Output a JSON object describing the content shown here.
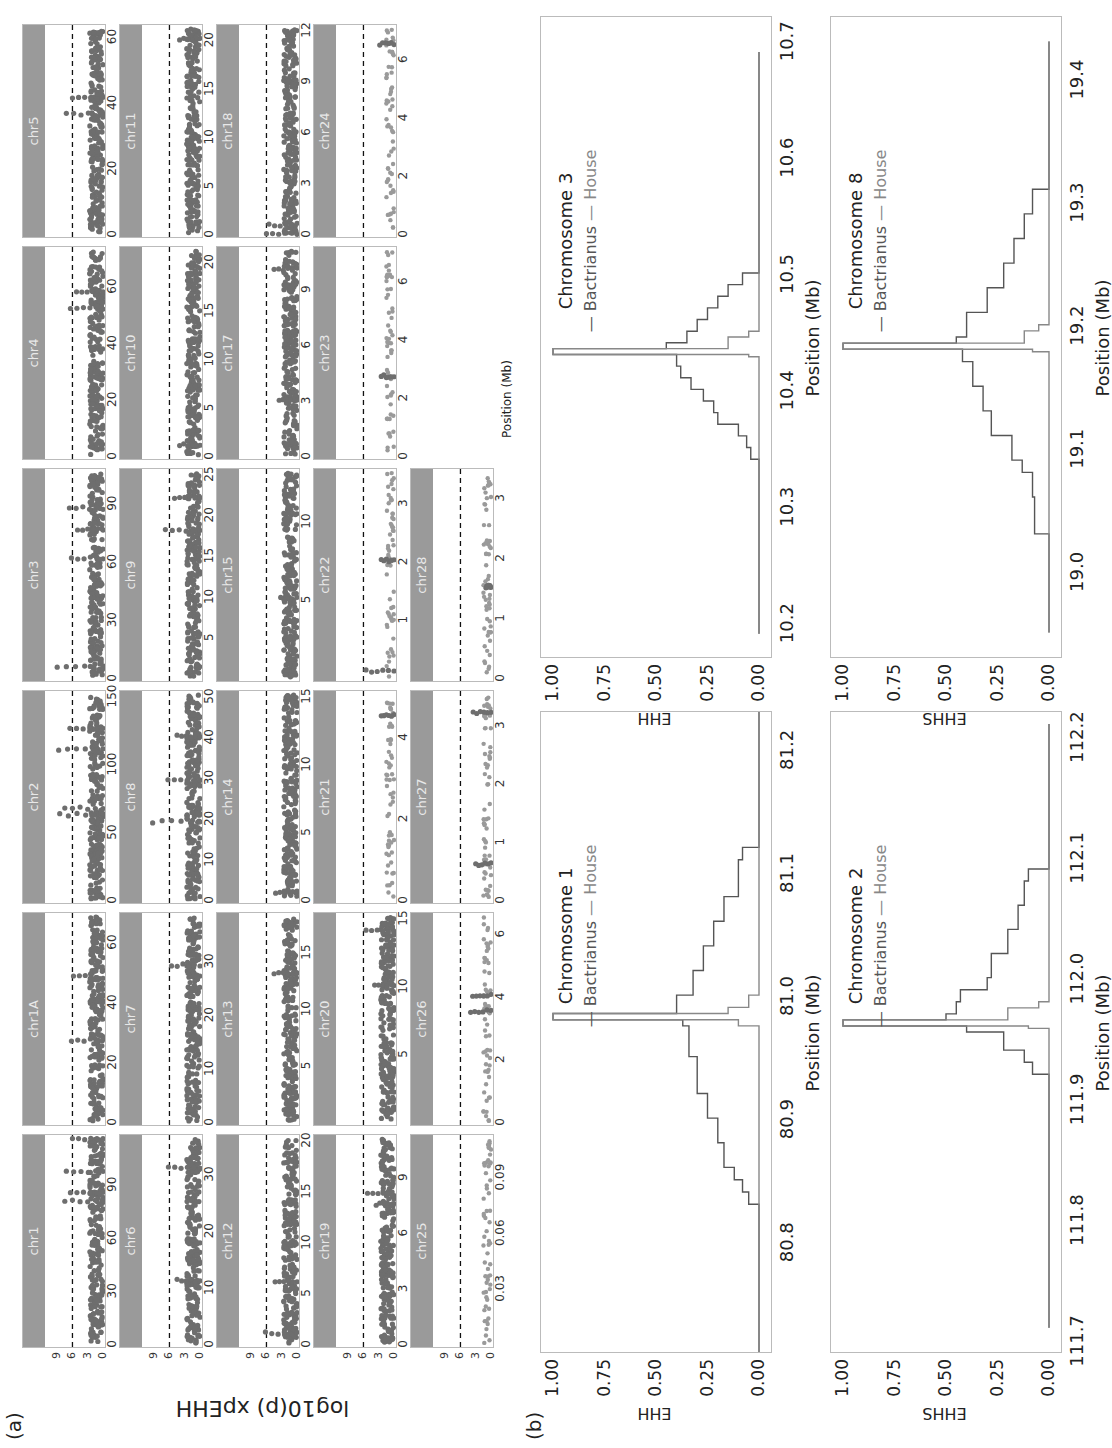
{
  "figure": {
    "panel_a_label": "(a)",
    "panel_b_label": "(b)",
    "panel_a_ylabel": "log10(p) xpEHH",
    "panel_a_xlabel": "Position (Mb)",
    "threshold": 6,
    "colors": {
      "strip": "#9a9a9a",
      "strip_text": "#e8e8e8",
      "points": "#6e6e6e",
      "points_light": "#9a9a9a",
      "threshold_line": "#111111",
      "bactrianus": "#555555",
      "house": "#888888"
    }
  },
  "chart_data": [
    {
      "type": "scatter",
      "title": "xpEHH Manhattan plots per chromosome",
      "ylabel": "log10(p) xpEHH",
      "xlabel": "Position (Mb)",
      "y_ticks": [
        0,
        3,
        6,
        9
      ],
      "ylim": [
        0,
        11
      ],
      "threshold_line": 6,
      "panels": [
        {
          "chr": "chr1",
          "x_ticks": [
            "0",
            "30",
            "60",
            "90"
          ],
          "xmax": 115,
          "peaks": [
            [
              80,
              7.5
            ],
            [
              97,
              7.2
            ],
            [
              85,
              6.4
            ],
            [
              115,
              6.0
            ]
          ]
        },
        {
          "chr": "chr1A",
          "x_ticks": [
            "0",
            "20",
            "40",
            "60"
          ],
          "xmax": 68,
          "peaks": [
            [
              27,
              6.2
            ],
            [
              48,
              5.8
            ]
          ]
        },
        {
          "chr": "chr2",
          "x_ticks": [
            "0",
            "50",
            "100",
            "150"
          ],
          "xmax": 150,
          "peaks": [
            [
              62,
              8.5
            ],
            [
              110,
              8.7
            ],
            [
              67,
              7.5
            ],
            [
              125,
              6.5
            ]
          ]
        },
        {
          "chr": "chr3",
          "x_ticks": [
            "0",
            "30",
            "60",
            "90"
          ],
          "xmax": 105,
          "peaks": [
            [
              5,
              9.0
            ],
            [
              61,
              6.2
            ],
            [
              87,
              6.6
            ],
            [
              76,
              5.0
            ]
          ]
        },
        {
          "chr": "chr4",
          "x_ticks": [
            "0",
            "20",
            "40",
            "60"
          ],
          "xmax": 72,
          "peaks": [
            [
              52,
              6.4
            ],
            [
              58,
              5.2
            ]
          ]
        },
        {
          "chr": "chr5",
          "x_ticks": [
            "0",
            "20",
            "40",
            "60"
          ],
          "xmax": 62,
          "peaks": [
            [
              36,
              7.2
            ],
            [
              41,
              6.0
            ]
          ]
        },
        {
          "chr": "chr6",
          "x_ticks": [
            "0",
            "10",
            "20",
            "30"
          ],
          "xmax": 36,
          "peaks": [
            [
              31,
              6.2
            ],
            [
              11,
              4.5
            ]
          ]
        },
        {
          "chr": "chr7",
          "x_ticks": [
            "0",
            "10",
            "20",
            "30"
          ],
          "xmax": 38,
          "peaks": [
            [
              29,
              5.6
            ]
          ]
        },
        {
          "chr": "chr8",
          "x_ticks": [
            "0",
            "10",
            "20",
            "30",
            "40",
            "50"
          ],
          "xmax": 50,
          "peaks": [
            [
              19,
              9.3
            ],
            [
              29,
              6.3
            ],
            [
              40,
              4.5
            ]
          ]
        },
        {
          "chr": "chr9",
          "x_ticks": [
            "5",
            "10",
            "15",
            "20",
            "25"
          ],
          "xmax": 25,
          "peaks": [
            [
              18,
              6.8
            ],
            [
              22,
              5.0
            ]
          ]
        },
        {
          "chr": "chr10",
          "x_ticks": [
            "0",
            "5",
            "10",
            "15",
            "20"
          ],
          "xmax": 21,
          "peaks": [
            [
              1,
              4.0
            ]
          ]
        },
        {
          "chr": "chr11",
          "x_ticks": [
            "0",
            "5",
            "10",
            "15",
            "20"
          ],
          "xmax": 21,
          "peaks": [
            [
              20,
              4.0
            ]
          ]
        },
        {
          "chr": "chr12",
          "x_ticks": [
            "0",
            "5",
            "10",
            "15",
            "20"
          ],
          "xmax": 20,
          "peaks": [
            [
              1,
              6.2
            ],
            [
              6,
              4.3
            ]
          ]
        },
        {
          "chr": "chr13",
          "x_ticks": [
            "5",
            "10",
            "15"
          ],
          "xmax": 18,
          "peaks": [
            [
              13,
              4.5
            ]
          ]
        },
        {
          "chr": "chr14",
          "x_ticks": [
            "0",
            "5",
            "10",
            "15"
          ],
          "xmax": 15,
          "peaks": [
            [
              0.5,
              4.2
            ]
          ]
        },
        {
          "chr": "chr15",
          "x_ticks": [
            "5",
            "10"
          ],
          "xmax": 13,
          "peaks": [
            [
              5,
              3.2
            ]
          ]
        },
        {
          "chr": "chr17",
          "x_ticks": [
            "0",
            "3",
            "6",
            "9"
          ],
          "xmax": 11,
          "peaks": [
            [
              10,
              4.5
            ],
            [
              3,
              3.5
            ]
          ]
        },
        {
          "chr": "chr18",
          "x_ticks": [
            "0",
            "3",
            "6",
            "9",
            "12"
          ],
          "xmax": 12,
          "peaks": [
            [
              0,
              6.0
            ],
            [
              0.5,
              5.5
            ]
          ]
        },
        {
          "chr": "chr19",
          "x_ticks": [
            "0",
            "3",
            "6",
            "9"
          ],
          "xmax": 11,
          "peaks": [
            [
              8,
              5.2
            ],
            [
              7.5,
              3.5
            ]
          ]
        },
        {
          "chr": "chr20",
          "x_ticks": [
            "5",
            "10",
            "15"
          ],
          "xmax": 15,
          "peaks": [
            [
              14,
              5.5
            ],
            [
              10,
              3.8
            ]
          ]
        },
        {
          "chr": "chr21",
          "x_ticks": [
            "0",
            "2",
            "4"
          ],
          "xmax": 5,
          "peaks": [
            [
              4.5,
              2.5
            ]
          ]
        },
        {
          "chr": "chr22",
          "x_ticks": [
            "1",
            "2",
            "3"
          ],
          "xmax": 3.5,
          "peaks": [
            [
              0.1,
              5.5
            ],
            [
              2,
              2.5
            ]
          ]
        },
        {
          "chr": "chr23",
          "x_ticks": [
            "0",
            "2",
            "4",
            "6"
          ],
          "xmax": 7,
          "peaks": [
            [
              2.7,
              2.5
            ]
          ]
        },
        {
          "chr": "chr24",
          "x_ticks": [
            "0",
            "2",
            "4",
            "6"
          ],
          "xmax": 7,
          "peaks": [
            [
              6.5,
              2.8
            ]
          ]
        },
        {
          "chr": "chr25",
          "x_ticks": [
            "0.03",
            "0.06",
            "0.09"
          ],
          "xmax": 0.11,
          "peaks": []
        },
        {
          "chr": "chr26",
          "x_ticks": [
            "0",
            "2",
            "4",
            "6"
          ],
          "xmax": 6.5,
          "peaks": [
            [
              3.5,
              4.0
            ],
            [
              4,
              3.6
            ]
          ]
        },
        {
          "chr": "chr27",
          "x_ticks": [
            "0",
            "1",
            "2",
            "3"
          ],
          "xmax": 3.5,
          "peaks": [
            [
              3.2,
              3.5
            ],
            [
              0.6,
              3.0
            ]
          ]
        },
        {
          "chr": "chr28",
          "x_ticks": [
            "0",
            "1",
            "2",
            "3"
          ],
          "xmax": 3.4,
          "peaks": [
            [
              1.5,
              1.0
            ]
          ]
        }
      ]
    },
    {
      "type": "line",
      "title": "Chromosome 1",
      "ylabel": "EHH",
      "xlabel": "Position (Mb)",
      "x_ticks": [
        "80.8",
        "80.9",
        "81.0",
        "81.1",
        "81.2"
      ],
      "xlim": [
        80.71,
        81.23
      ],
      "y_ticks": [
        "0.00",
        "0.25",
        "0.50",
        "0.75",
        "1.00"
      ],
      "ylim": [
        0,
        1
      ],
      "legend": [
        "Bactrianus",
        "House"
      ],
      "core": 80.98,
      "series": [
        {
          "name": "Bactrianus",
          "x": [
            80.71,
            80.83,
            80.83,
            80.84,
            80.85,
            80.86,
            80.88,
            80.9,
            80.92,
            80.95,
            80.975,
            80.98,
            80.985,
            81.0,
            81.02,
            81.04,
            81.06,
            81.08,
            81.11,
            81.12,
            81.12,
            81.23
          ],
          "y": [
            0,
            0,
            0.05,
            0.08,
            0.12,
            0.17,
            0.2,
            0.25,
            0.3,
            0.34,
            0.37,
            1.0,
            0.4,
            0.32,
            0.27,
            0.22,
            0.17,
            0.1,
            0.08,
            0.07,
            0,
            0
          ]
        },
        {
          "name": "House",
          "x": [
            80.71,
            80.97,
            80.975,
            80.98,
            80.985,
            80.99,
            81.0,
            81.23
          ],
          "y": [
            0,
            0,
            0.1,
            1.0,
            0.15,
            0.05,
            0,
            0
          ]
        }
      ]
    },
    {
      "type": "line",
      "title": "Chromosome 2",
      "ylabel": "EHHS",
      "xlabel": "Position (Mb)",
      "x_ticks": [
        "111.7",
        "111.8",
        "111.9",
        "112.0",
        "112.1",
        "112.2"
      ],
      "xlim": [
        111.69,
        112.22
      ],
      "y_ticks": [
        "0.00",
        "0.25",
        "0.50",
        "0.75",
        "1.00"
      ],
      "ylim": [
        0,
        1
      ],
      "legend": [
        "Bactrianus",
        "House"
      ],
      "core": 111.96,
      "series": [
        {
          "name": "Bactrianus",
          "x": [
            111.71,
            111.92,
            111.92,
            111.93,
            111.94,
            111.955,
            111.96,
            111.965,
            111.97,
            111.98,
            111.99,
            112.0,
            112.02,
            112.04,
            112.06,
            112.08,
            112.09,
            112.09,
            112.21
          ],
          "y": [
            0,
            0,
            0.08,
            0.12,
            0.22,
            0.4,
            1.0,
            0.5,
            0.45,
            0.43,
            0.3,
            0.28,
            0.2,
            0.15,
            0.12,
            0.1,
            0.05,
            0,
            0
          ]
        },
        {
          "name": "House",
          "x": [
            111.71,
            111.955,
            111.958,
            111.96,
            111.965,
            111.975,
            111.98,
            112.21
          ],
          "y": [
            0,
            0,
            0.1,
            1.0,
            0.2,
            0.05,
            0,
            0
          ]
        }
      ]
    },
    {
      "type": "line",
      "title": "Chromosome 3",
      "ylabel": "EHH",
      "xlabel": "Position (Mb)",
      "x_ticks": [
        "10.2",
        "10.3",
        "10.4",
        "10.5",
        "10.6",
        "10.7"
      ],
      "xlim": [
        10.17,
        10.72
      ],
      "y_ticks": [
        "0.00",
        "0.25",
        "0.50",
        "0.75",
        "1.00"
      ],
      "ylim": [
        0,
        1
      ],
      "legend": [
        "Bactrianus",
        "House"
      ],
      "core": 10.43,
      "series": [
        {
          "name": "Bactrianus",
          "x": [
            10.19,
            10.34,
            10.34,
            10.35,
            10.36,
            10.37,
            10.38,
            10.39,
            10.4,
            10.41,
            10.42,
            10.43,
            10.435,
            10.44,
            10.45,
            10.46,
            10.47,
            10.48,
            10.49,
            10.5,
            10.5,
            10.69
          ],
          "y": [
            0,
            0,
            0.04,
            0.06,
            0.1,
            0.2,
            0.22,
            0.27,
            0.33,
            0.38,
            0.4,
            1.0,
            0.45,
            0.35,
            0.3,
            0.25,
            0.2,
            0.15,
            0.08,
            0.03,
            0,
            0
          ]
        },
        {
          "name": "House",
          "x": [
            10.19,
            10.425,
            10.428,
            10.43,
            10.435,
            10.445,
            10.45,
            10.69
          ],
          "y": [
            0,
            0,
            0.05,
            1.0,
            0.15,
            0.05,
            0,
            0
          ]
        }
      ]
    },
    {
      "type": "line",
      "title": "Chromosome 8",
      "ylabel": "EHHS",
      "xlabel": "Position (Mb)",
      "x_ticks": [
        "19.0",
        "19.1",
        "19.2",
        "19.3",
        "19.4"
      ],
      "xlim": [
        18.93,
        19.45
      ],
      "y_ticks": [
        "0.00",
        "0.25",
        "0.50",
        "0.75",
        "1.00"
      ],
      "ylim": [
        0,
        1
      ],
      "legend": [
        "Bactrianus",
        "House"
      ],
      "core": 19.18,
      "series": [
        {
          "name": "Bactrianus",
          "x": [
            18.95,
            19.03,
            19.03,
            19.06,
            19.08,
            19.09,
            19.11,
            19.13,
            19.15,
            19.17,
            19.18,
            19.185,
            19.19,
            19.21,
            19.23,
            19.25,
            19.27,
            19.29,
            19.31,
            19.31,
            19.43
          ],
          "y": [
            0,
            0,
            0.07,
            0.08,
            0.13,
            0.18,
            0.28,
            0.32,
            0.37,
            0.42,
            1.0,
            0.45,
            0.4,
            0.3,
            0.22,
            0.17,
            0.12,
            0.08,
            0.03,
            0,
            0
          ]
        },
        {
          "name": "House",
          "x": [
            18.95,
            19.175,
            19.178,
            19.18,
            19.185,
            19.195,
            19.2,
            19.43
          ],
          "y": [
            0,
            0,
            0.08,
            1.0,
            0.12,
            0.05,
            0,
            0
          ]
        }
      ]
    }
  ],
  "panel_b": {
    "plots": [
      {
        "title": "Chromosome 1",
        "legend_a": "— Bactrianus",
        "legend_b": "— House",
        "ylabel": "EHH",
        "xlabel": "Position (Mb)"
      },
      {
        "title": "Chromosome 2",
        "legend_a": "— Bactrianus",
        "legend_b": "— House",
        "ylabel": "EHHS",
        "xlabel": "Position (Mb)"
      },
      {
        "title": "Chromosome 3",
        "legend_a": "— Bactrianus",
        "legend_b": "— House",
        "ylabel": "EHH",
        "xlabel": "Position (Mb)"
      },
      {
        "title": "Chromosome 8",
        "legend_a": "— Bactrianus",
        "legend_b": "— House",
        "ylabel": "EHHS",
        "xlabel": "Position (Mb)"
      }
    ]
  }
}
